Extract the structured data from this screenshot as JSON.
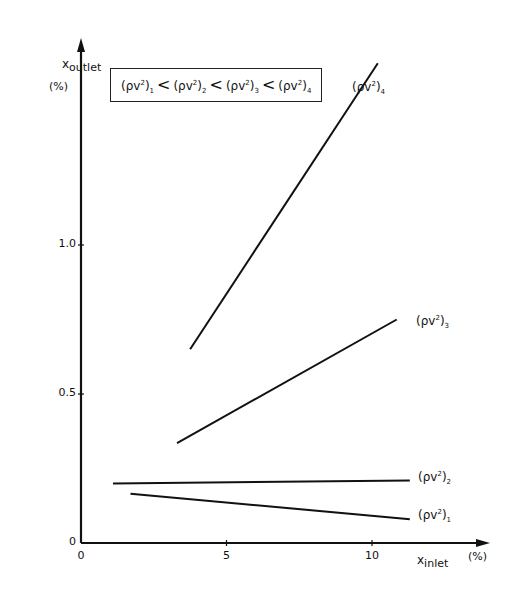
{
  "chart_data": {
    "type": "line",
    "title": "",
    "xlabel": "x_inlet",
    "xlabel_main": "x",
    "xlabel_sub": "inlet",
    "xunit": "(%)",
    "ylabel": "x_outlet",
    "ylabel_main": "x",
    "ylabel_sub": "outlet",
    "yunit": "(%)",
    "xlim": [
      0,
      12.5
    ],
    "ylim": [
      0,
      1.65
    ],
    "xticks": [
      0,
      5,
      10
    ],
    "xtick_labels": [
      "0",
      "5",
      "10"
    ],
    "yticks": [
      0,
      0.5,
      1.0
    ],
    "ytick_labels": [
      "0",
      "0.5",
      "1.0"
    ],
    "grid": false,
    "legend_text": "(ρv²)₁ < (ρv²)₂ < (ρv²)₃ < (ρv²)₄",
    "legend_parts": [
      "1",
      "2",
      "3",
      "4"
    ],
    "series": [
      {
        "name": "(ρv²)₁",
        "index": "1",
        "x": [
          1.7,
          11.3
        ],
        "y": [
          0.165,
          0.08
        ]
      },
      {
        "name": "(ρv²)₂",
        "index": "2",
        "x": [
          1.1,
          11.3
        ],
        "y": [
          0.2,
          0.21
        ]
      },
      {
        "name": "(ρv²)₃",
        "index": "3",
        "x": [
          3.3,
          10.85
        ],
        "y": [
          0.335,
          0.75
        ]
      },
      {
        "name": "(ρv²)₄",
        "index": "4",
        "x": [
          3.75,
          10.2
        ],
        "y": [
          0.65,
          1.61
        ]
      }
    ]
  },
  "colors": {
    "ink": "#111111",
    "background": "#ffffff"
  }
}
